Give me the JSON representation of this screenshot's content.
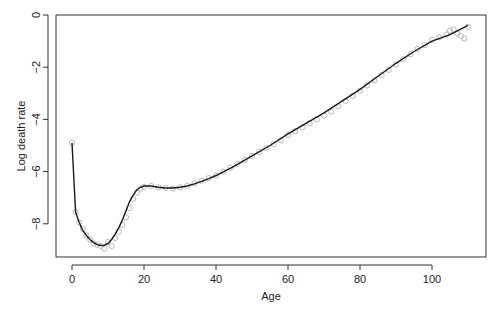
{
  "chart_data": {
    "type": "scatter",
    "title": "",
    "xlabel": "Age",
    "ylabel": "Log death rate",
    "xlim": [
      -4,
      115
    ],
    "ylim": [
      -9.3,
      0
    ],
    "xticks": [
      0,
      20,
      40,
      60,
      80,
      100
    ],
    "yticks": [
      0,
      -2,
      -4,
      -6,
      -8
    ],
    "grid": false,
    "legend": null,
    "series": [
      {
        "name": "observed",
        "style": "open-circles",
        "color": "#b0b0b0",
        "x": [
          0,
          1,
          2,
          3,
          4,
          5,
          6,
          7,
          8,
          9,
          10,
          11,
          12,
          13,
          14,
          15,
          16,
          17,
          18,
          19,
          20,
          22,
          24,
          26,
          28,
          30,
          32,
          34,
          36,
          38,
          40,
          42,
          44,
          46,
          48,
          50,
          52,
          54,
          56,
          58,
          60,
          62,
          64,
          66,
          68,
          70,
          72,
          74,
          76,
          78,
          80,
          82,
          84,
          86,
          88,
          90,
          92,
          94,
          96,
          98,
          100,
          102,
          104,
          105,
          106,
          107,
          108,
          109,
          110
        ],
        "y": [
          -4.9,
          -7.55,
          -7.95,
          -8.2,
          -8.45,
          -8.6,
          -8.75,
          -8.8,
          -8.85,
          -8.95,
          -8.7,
          -8.85,
          -8.55,
          -8.3,
          -8.05,
          -7.75,
          -7.4,
          -7.05,
          -6.8,
          -6.65,
          -6.58,
          -6.55,
          -6.6,
          -6.62,
          -6.65,
          -6.6,
          -6.55,
          -6.45,
          -6.35,
          -6.25,
          -6.15,
          -6.0,
          -5.85,
          -5.7,
          -5.55,
          -5.4,
          -5.25,
          -5.1,
          -4.95,
          -4.8,
          -4.6,
          -4.45,
          -4.3,
          -4.15,
          -4.0,
          -3.85,
          -3.7,
          -3.5,
          -3.3,
          -3.1,
          -2.9,
          -2.7,
          -2.5,
          -2.3,
          -2.1,
          -1.9,
          -1.7,
          -1.5,
          -1.3,
          -1.15,
          -0.95,
          -0.85,
          -0.75,
          -0.6,
          -0.55,
          -0.7,
          -0.8,
          -0.9,
          -0.45
        ]
      },
      {
        "name": "smoothed fit",
        "style": "line",
        "color": "#1a1a1a",
        "x": [
          0,
          1,
          2,
          3,
          4,
          5,
          6,
          7,
          8,
          9,
          10,
          11,
          12,
          13,
          14,
          15,
          16,
          17,
          18,
          19,
          20,
          22,
          24,
          26,
          28,
          30,
          32,
          34,
          36,
          38,
          40,
          45,
          50,
          55,
          60,
          65,
          70,
          75,
          80,
          85,
          90,
          95,
          100,
          105,
          110
        ],
        "y": [
          -4.9,
          -7.55,
          -7.95,
          -8.25,
          -8.45,
          -8.6,
          -8.72,
          -8.8,
          -8.83,
          -8.82,
          -8.75,
          -8.6,
          -8.4,
          -8.15,
          -7.85,
          -7.5,
          -7.15,
          -6.9,
          -6.7,
          -6.6,
          -6.55,
          -6.55,
          -6.6,
          -6.63,
          -6.63,
          -6.6,
          -6.55,
          -6.47,
          -6.37,
          -6.27,
          -6.15,
          -5.8,
          -5.4,
          -5.0,
          -4.55,
          -4.15,
          -3.75,
          -3.3,
          -2.85,
          -2.35,
          -1.85,
          -1.4,
          -1.0,
          -0.75,
          -0.4
        ]
      }
    ]
  }
}
